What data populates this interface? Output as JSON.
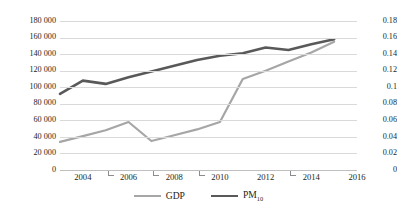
{
  "chart_data": {
    "type": "line",
    "title": "",
    "subtitle": "",
    "xlabel": "",
    "ylabel": "",
    "grid": true,
    "legend_position": "bottom",
    "x": [
      2003,
      2004,
      2005,
      2006,
      2007,
      2008,
      2009,
      2010,
      2011,
      2012,
      2013,
      2014,
      2015
    ],
    "x_axis": {
      "min": 2003,
      "max": 2016,
      "tick_labels": [
        "2004",
        "2006",
        "2008",
        "2010",
        "2012",
        "2014",
        "2016"
      ],
      "tick_values": [
        2004,
        2006,
        2008,
        2010,
        2012,
        2014,
        2016
      ]
    },
    "y_axis_left": {
      "label": "",
      "min": 0,
      "max": 180000,
      "step": 20000,
      "tick_labels": [
        "0",
        "20 000",
        "40 000",
        "60 000",
        "80 000",
        "100 000",
        "120 000",
        "140 000",
        "160 000",
        "180 000"
      ],
      "tick_values": [
        0,
        20000,
        40000,
        60000,
        80000,
        100000,
        120000,
        140000,
        160000,
        180000
      ]
    },
    "y_axis_right": {
      "label": "",
      "min": 0,
      "max": 0.18,
      "step": 0.02,
      "tick_labels": [
        "0",
        "0.02",
        "0.04",
        "0.06",
        "0.08",
        "0.1",
        "0.12",
        "0.14",
        "0.16",
        "0.18"
      ],
      "tick_values": [
        0,
        0.02,
        0.04,
        0.06,
        0.08,
        0.1,
        0.12,
        0.14,
        0.16,
        0.18
      ]
    },
    "series": [
      {
        "name": "GDP",
        "legend_label": "GDP",
        "axis": "left",
        "color": "#a6a6a6",
        "line_width": 2.2,
        "values": [
          34000,
          41000,
          48000,
          58000,
          35000,
          42000,
          49000,
          58000,
          110000,
          120000,
          131000,
          142000,
          155000
        ]
      },
      {
        "name": "PM10",
        "legend_label": "PM",
        "legend_label_sub": "10",
        "axis": "right",
        "color": "#595959",
        "line_width": 2.6,
        "values": [
          0.092,
          0.108,
          0.104,
          0.112,
          0.119,
          0.126,
          0.133,
          0.138,
          0.141,
          0.148,
          0.145,
          0.152,
          0.158
        ]
      }
    ]
  },
  "legend": {
    "gdp_label": "GDP",
    "pm_label": "PM",
    "pm_sub": "10"
  },
  "axis_left_labels": {
    "t0": "0",
    "t1": "20 000",
    "t2": "40 000",
    "t3": "60 000",
    "t4": "80 000",
    "t5": "100 000",
    "t6": "120 000",
    "t7": "140 000",
    "t8": "160 000",
    "t9": "180 000"
  },
  "axis_right_labels": {
    "t0": "0",
    "t1": "0.02",
    "t2": "0.04",
    "t3": "0.06",
    "t4": "0.08",
    "t5": "0.1",
    "t6": "0.12",
    "t7": "0.14",
    "t8": "0.16",
    "t9": "0.18"
  },
  "axis_x_labels": {
    "t0": "2004",
    "t1": "2006",
    "t2": "2008",
    "t3": "2010",
    "t4": "2012",
    "t5": "2014",
    "t6": "2016"
  },
  "colors": {
    "gdp": "#a6a6a6",
    "pm10": "#595959",
    "gridline": "#d9d9d9",
    "text": "#231f20",
    "background": "#ffffff"
  }
}
